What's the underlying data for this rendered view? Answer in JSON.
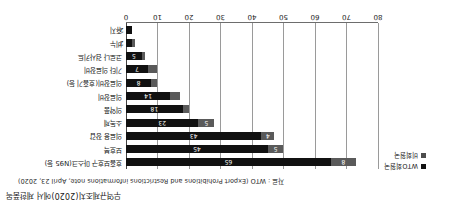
{
  "title": "무역규제조치(2020)에서 제한품목",
  "source": "자료 : WTO (Export Prohibitions and Restrictions informations note, April 23, 2020)",
  "legend": {
    "items": [
      {
        "label": "WTO회원국",
        "color": "#111111",
        "key": "wto"
      },
      {
        "label": "비회원국",
        "color": "#5a5a5a",
        "key": "nonwto"
      }
    ]
  },
  "axis": {
    "ticks": [
      "0",
      "10",
      "20",
      "30",
      "40",
      "50",
      "60",
      "70",
      "80"
    ],
    "min": 0,
    "max": 80
  },
  "chart_data": {
    "type": "bar",
    "orientation": "horizontal",
    "stacked": true,
    "title": "무역규제조치(2020)에서 제한품목",
    "subtitle": "",
    "xlabel": "",
    "ylabel": "",
    "xlim": [
      0,
      80
    ],
    "grid": true,
    "legend_position": "top-left",
    "categories": [
      "호흡보호구 마스크(N95 등)",
      "보호복",
      "의료용 장갑",
      "소독제",
      "의약품",
      "의료장비",
      "의료장비(호흡기 등)",
      "기타 의료장비",
      "코로나 검사키트",
      "비누",
      "휴지"
    ],
    "series": [
      {
        "name": "WTO회원국",
        "color": "#111111",
        "values": [
          65,
          45,
          43,
          23,
          18,
          14,
          8,
          7,
          5,
          2,
          2
        ]
      },
      {
        "name": "비회원국",
        "color": "#5a5a5a",
        "values": [
          8,
          5,
          4,
          5,
          2,
          3,
          2,
          3,
          1,
          1,
          0
        ]
      }
    ]
  }
}
